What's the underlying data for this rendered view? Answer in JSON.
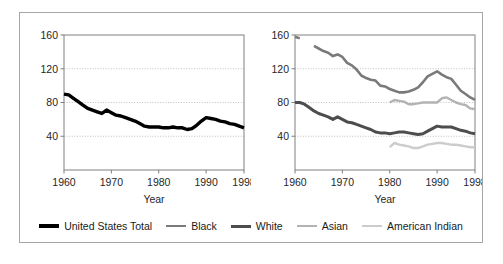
{
  "figure": {
    "width": 503,
    "height": 264,
    "background": "#ffffff",
    "frame_color": "#a6a6a6"
  },
  "colors": {
    "united_states_total": "#000000",
    "black": "#7a7a7a",
    "white": "#4d4d4d",
    "asian": "#b3b3b3",
    "american_indian": "#cccccc",
    "axis": "#808080",
    "gridline": "#b0b0b0",
    "text": "#262626"
  },
  "legend": {
    "items": [
      {
        "label": "United States Total",
        "color": "#000000",
        "width": 3.4
      },
      {
        "label": "Black",
        "color": "#7a7a7a",
        "width": 2.6
      },
      {
        "label": "White",
        "color": "#4d4d4d",
        "width": 3.0
      },
      {
        "label": "Asian",
        "color": "#b3b3b3",
        "width": 2.4
      },
      {
        "label": "American Indian",
        "color": "#cccccc",
        "width": 2.4
      }
    ]
  },
  "chart_data": [
    {
      "type": "line",
      "panel": "left",
      "title": "",
      "xlabel": "Year",
      "ylabel": "",
      "xlim": [
        1960,
        1998
      ],
      "ylim": [
        0,
        160
      ],
      "xticks": [
        1960,
        1970,
        1980,
        1990,
        1998
      ],
      "xtick_labels": [
        "1960",
        "1970",
        "1980",
        "1990",
        "1998"
      ],
      "yticks": [
        40,
        80,
        120,
        160
      ],
      "ytick_labels": [
        "40",
        "80",
        "120",
        "160"
      ],
      "grid": "horizontal-dotted",
      "legend_position": "bottom-shared",
      "series": [
        {
          "name": "United States Total",
          "color": "#000000",
          "x": [
            1960,
            1961,
            1962,
            1963,
            1964,
            1965,
            1966,
            1967,
            1968,
            1969,
            1970,
            1971,
            1972,
            1973,
            1974,
            1975,
            1976,
            1977,
            1978,
            1979,
            1980,
            1981,
            1982,
            1983,
            1984,
            1985,
            1986,
            1987,
            1988,
            1989,
            1990,
            1991,
            1992,
            1993,
            1994,
            1995,
            1996,
            1997,
            1998
          ],
          "values": [
            90,
            89,
            85,
            81,
            77,
            73,
            71,
            69,
            67,
            71,
            68,
            65,
            64,
            62,
            60,
            58,
            55,
            52,
            51,
            51,
            51,
            50,
            50,
            51,
            50,
            50,
            48,
            49,
            53,
            58,
            62,
            61,
            60,
            58,
            57,
            55,
            54,
            52,
            50
          ]
        }
      ]
    },
    {
      "type": "line",
      "panel": "right",
      "title": "",
      "xlabel": "Year",
      "ylabel": "",
      "xlim": [
        1960,
        1998
      ],
      "ylim": [
        0,
        160
      ],
      "xticks": [
        1960,
        1970,
        1980,
        1990,
        1998
      ],
      "xtick_labels": [
        "1960",
        "1970",
        "1980",
        "1990",
        "1998"
      ],
      "yticks": [
        40,
        80,
        120,
        160
      ],
      "ytick_labels": [
        "40",
        "80",
        "120",
        "160"
      ],
      "grid": "horizontal-dotted",
      "legend_position": "bottom-shared",
      "series": [
        {
          "name": "Black",
          "color": "#7a7a7a",
          "x": [
            1960,
            1961
          ],
          "values": [
            158,
            156
          ]
        },
        {
          "name": "Black",
          "color": "#7a7a7a",
          "x": [
            1964,
            1965,
            1966,
            1967,
            1968,
            1969,
            1970,
            1971,
            1972,
            1973,
            1974,
            1975,
            1976,
            1977,
            1978,
            1979,
            1980,
            1981,
            1982,
            1983,
            1984,
            1985,
            1986,
            1987,
            1988,
            1989,
            1990,
            1991,
            1992,
            1993,
            1994,
            1995,
            1996,
            1997,
            1998
          ],
          "values": [
            147,
            144,
            141,
            139,
            135,
            137,
            134,
            127,
            124,
            119,
            112,
            109,
            107,
            106,
            100,
            99,
            96,
            94,
            92,
            92,
            93,
            95,
            98,
            104,
            111,
            114,
            117,
            113,
            110,
            108,
            101,
            94,
            90,
            86,
            83
          ]
        },
        {
          "name": "White",
          "color": "#4d4d4d",
          "x": [
            1960,
            1961,
            1962,
            1963,
            1964,
            1965,
            1966,
            1967,
            1968,
            1969,
            1970,
            1971,
            1972,
            1973,
            1974,
            1975,
            1976,
            1977,
            1978,
            1979,
            1980,
            1981,
            1982,
            1983,
            1984,
            1985,
            1986,
            1987,
            1988,
            1989,
            1990,
            1991,
            1992,
            1993,
            1994,
            1995,
            1996,
            1997,
            1998
          ],
          "values": [
            80,
            80,
            78,
            74,
            70,
            67,
            65,
            63,
            60,
            63,
            60,
            57,
            56,
            54,
            52,
            50,
            48,
            45,
            44,
            44,
            43,
            44,
            45,
            45,
            44,
            43,
            42,
            43,
            46,
            49,
            52,
            51,
            51,
            51,
            49,
            47,
            46,
            44,
            43
          ]
        },
        {
          "name": "Asian",
          "color": "#b3b3b3",
          "x": [
            1980,
            1981,
            1982,
            1983,
            1984,
            1985,
            1986,
            1987,
            1988,
            1989,
            1990,
            1991,
            1992,
            1993,
            1994,
            1995,
            1996,
            1997,
            1998
          ],
          "values": [
            80,
            83,
            82,
            81,
            78,
            78,
            79,
            80,
            80,
            80,
            80,
            85,
            86,
            83,
            80,
            78,
            77,
            73,
            72
          ]
        },
        {
          "name": "American Indian",
          "color": "#cccccc",
          "x": [
            1980,
            1981,
            1982,
            1983,
            1984,
            1985,
            1986,
            1987,
            1988,
            1989,
            1990,
            1991,
            1992,
            1993,
            1994,
            1995,
            1996,
            1997,
            1998
          ],
          "values": [
            27,
            32,
            30,
            29,
            28,
            26,
            26,
            28,
            30,
            31,
            32,
            32,
            31,
            30,
            30,
            29,
            28,
            27,
            27
          ]
        }
      ]
    }
  ]
}
